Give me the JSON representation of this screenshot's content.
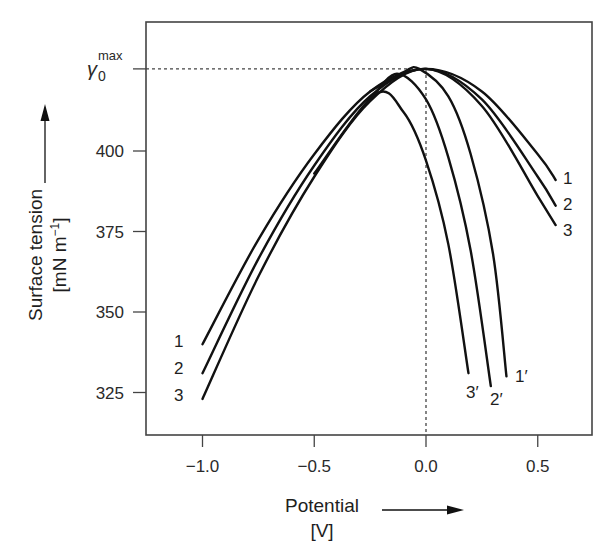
{
  "chart_data": {
    "type": "line",
    "title": "",
    "xlabel": "Potential",
    "xlabel_unit": "[V]",
    "ylabel": "Surface tension",
    "ylabel_unit": "[mN m⁻¹]",
    "xlim": [
      -1.25,
      0.75
    ],
    "ylim": [
      312,
      439
    ],
    "grid": false,
    "legend": "inline labels at curve ends",
    "x_ticks": [
      {
        "value": -1.0,
        "label": "−1.0"
      },
      {
        "value": -0.5,
        "label": "−0.5"
      },
      {
        "value": 0.0,
        "label": "0.0"
      },
      {
        "value": 0.5,
        "label": "0.5"
      }
    ],
    "y_ticks": [
      {
        "value": 325,
        "label": "325"
      },
      {
        "value": 350,
        "label": "350"
      },
      {
        "value": 375,
        "label": "375"
      },
      {
        "value": 400,
        "label": "400"
      },
      {
        "value": 425.5,
        "label": "γ",
        "sub": "0",
        "sup": "max"
      }
    ],
    "reference_lines": {
      "horizontal_y": 425.5,
      "vertical_x": 0.0,
      "style": "dotted"
    },
    "series": [
      {
        "name": "1",
        "label_side": "both",
        "x": [
          -1.0,
          -0.75,
          -0.5,
          -0.25,
          0.0,
          0.25,
          0.5,
          0.58
        ],
        "values": [
          340.0,
          372.5,
          399.0,
          418.5,
          425.5,
          418.5,
          399.0,
          391.0
        ]
      },
      {
        "name": "2",
        "label_side": "both",
        "x": [
          -1.0,
          -0.75,
          -0.5,
          -0.25,
          0.0,
          0.25,
          0.5,
          0.58
        ],
        "values": [
          331.0,
          366.5,
          395.5,
          417.0,
          425.5,
          416.0,
          392.0,
          383.0
        ]
      },
      {
        "name": "3",
        "label_side": "both",
        "x": [
          -1.0,
          -0.75,
          -0.5,
          -0.25,
          0.0,
          0.25,
          0.5,
          0.58
        ],
        "values": [
          323.0,
          361.0,
          392.0,
          415.5,
          425.5,
          414.0,
          386.0,
          377.0
        ]
      },
      {
        "name": "1′",
        "label_side": "end",
        "x": [
          -0.25,
          -0.1,
          -0.03,
          0.1,
          0.2,
          0.3,
          0.36
        ],
        "values": [
          418.5,
          424.5,
          425.5,
          417.0,
          399.0,
          368.0,
          330.0
        ]
      },
      {
        "name": "2′",
        "label_side": "end",
        "x": [
          -0.25,
          -0.13,
          0.0,
          0.1,
          0.2,
          0.29
        ],
        "values": [
          416.0,
          424.0,
          416.0,
          398.0,
          369.0,
          327.0
        ]
      },
      {
        "name": "3′",
        "label_side": "end",
        "x": [
          -0.5,
          -0.23,
          -0.1,
          0.0,
          0.1,
          0.19
        ],
        "values": [
          393.0,
          417.5,
          412.0,
          397.0,
          371.0,
          331.0
        ]
      }
    ]
  },
  "labels": {
    "x_title": "Potential",
    "x_unit": "[V]",
    "y_title": "Surface tension",
    "y_unit_main": "[mN m",
    "y_unit_sup": "−1",
    "y_unit_close": "]",
    "gamma_symbol": "γ",
    "gamma_sub": "0",
    "gamma_sup": "max"
  },
  "colors": {
    "curve": "#111111",
    "axis": "#444444",
    "reference": "#444444",
    "background": "#ffffff"
  }
}
